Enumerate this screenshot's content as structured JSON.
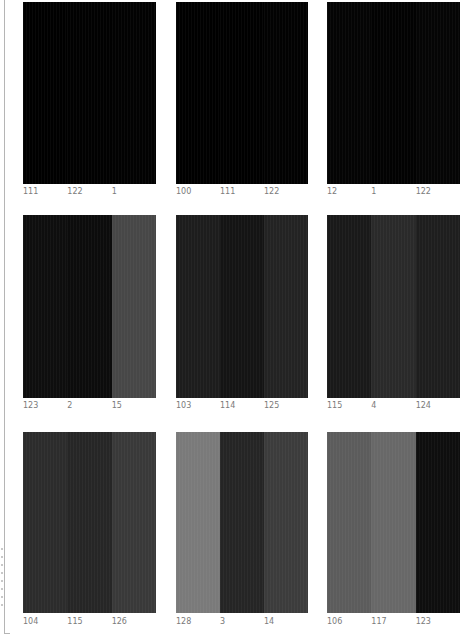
{
  "grid": {
    "rows": [
      {
        "top": 2,
        "height": 182,
        "label_top": 187,
        "panels": [
          {
            "left": 23,
            "width": 133,
            "stripes": [
              {
                "label": "111",
                "color": "#000000"
              },
              {
                "label": "122",
                "color": "#010101"
              },
              {
                "label": "1",
                "color": "#020202"
              }
            ]
          },
          {
            "left": 176,
            "width": 132,
            "stripes": [
              {
                "label": "100",
                "color": "#000000"
              },
              {
                "label": "111",
                "color": "#000000"
              },
              {
                "label": "122",
                "color": "#020202"
              }
            ]
          },
          {
            "left": 327,
            "width": 133,
            "stripes": [
              {
                "label": "12",
                "color": "#040404"
              },
              {
                "label": "1",
                "color": "#020202"
              },
              {
                "label": "122",
                "color": "#050505"
              }
            ]
          }
        ]
      },
      {
        "top": 215,
        "height": 183,
        "label_top": 401,
        "panels": [
          {
            "left": 23,
            "width": 133,
            "stripes": [
              {
                "label": "123",
                "color": "#0e0e0e"
              },
              {
                "label": "2",
                "color": "#0c0c0c"
              },
              {
                "label": "15",
                "color": "#474747"
              }
            ]
          },
          {
            "left": 176,
            "width": 132,
            "stripes": [
              {
                "label": "103",
                "color": "#1d1d1d"
              },
              {
                "label": "114",
                "color": "#141414"
              },
              {
                "label": "125",
                "color": "#232323"
              }
            ]
          },
          {
            "left": 327,
            "width": 133,
            "stripes": [
              {
                "label": "115",
                "color": "#191919"
              },
              {
                "label": "4",
                "color": "#2a2a2a"
              },
              {
                "label": "124",
                "color": "#1e1e1e"
              }
            ]
          }
        ]
      },
      {
        "top": 432,
        "height": 181,
        "label_top": 617,
        "panels": [
          {
            "left": 23,
            "width": 133,
            "stripes": [
              {
                "label": "104",
                "color": "#2c2c2c"
              },
              {
                "label": "115",
                "color": "#262626"
              },
              {
                "label": "126",
                "color": "#393939"
              }
            ]
          },
          {
            "left": 176,
            "width": 132,
            "stripes": [
              {
                "label": "128",
                "color": "#7a7a7a"
              },
              {
                "label": "3",
                "color": "#252525"
              },
              {
                "label": "14",
                "color": "#3c3c3c"
              }
            ]
          },
          {
            "left": 327,
            "width": 133,
            "stripes": [
              {
                "label": "106",
                "color": "#5c5c5c"
              },
              {
                "label": "117",
                "color": "#686868"
              },
              {
                "label": "123",
                "color": "#0e0e0e"
              }
            ]
          }
        ]
      }
    ]
  }
}
